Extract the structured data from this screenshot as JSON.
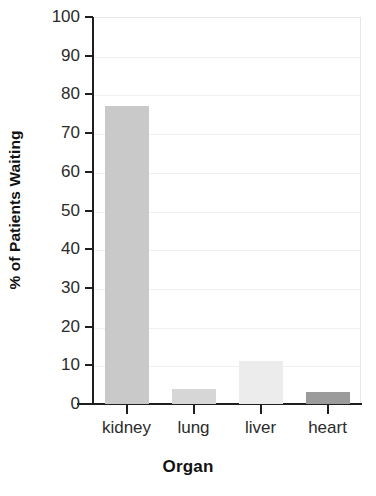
{
  "chart_data": {
    "type": "bar",
    "title": "",
    "xlabel": "Organ",
    "ylabel": "% of Patients Waiting",
    "categories": [
      "kidney",
      "lung",
      "liver",
      "heart"
    ],
    "values": [
      77,
      4,
      11,
      3
    ],
    "ylim": [
      0,
      100
    ],
    "yticks": [
      0,
      10,
      20,
      30,
      40,
      50,
      60,
      70,
      80,
      90,
      100
    ],
    "ytick_labels": [
      "0",
      "10",
      "20",
      "30",
      "40",
      "50",
      "60",
      "70",
      "80",
      "90",
      "100"
    ],
    "grid": true,
    "legend": "none",
    "bar_colors": [
      "#c9c9c9",
      "#d6d6d6",
      "#ececec",
      "#9b9b9b"
    ],
    "axis_color": "#1f1f1f",
    "gridline_color": "#f0f0f0",
    "background_color": "#ffffff"
  },
  "axis": {
    "y_title": "% of Patients Waiting",
    "x_title": "Organ"
  },
  "ticks": {
    "y": [
      "100",
      "90",
      "80",
      "70",
      "60",
      "50",
      "40",
      "30",
      "20",
      "10",
      "0"
    ],
    "x": [
      "kidney",
      "lung",
      "liver",
      "heart"
    ]
  }
}
